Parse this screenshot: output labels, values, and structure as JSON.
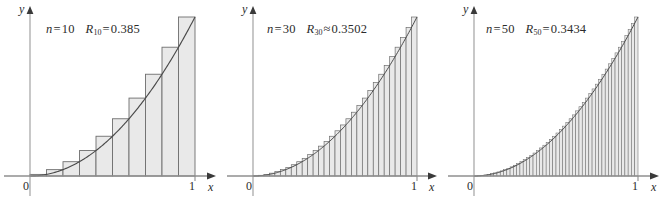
{
  "figure": {
    "background_color": "#ffffff",
    "bar_fill_color": "#e9e9e9",
    "bar_stroke_color": "#6e6e6e",
    "curve_color": "#4a4a4a",
    "axis_color": "#8a8a8a",
    "text_color": "#2b2b2b"
  },
  "panels": [
    {
      "id": "panel-n10",
      "annotation": {
        "n_symbol": "n",
        "n_relation": "=",
        "n_value": "10",
        "r_symbol": "R",
        "r_subscript": "10",
        "r_relation": "=",
        "r_value": "0.385",
        "full_text": "n = 10   R10 = 0.385"
      },
      "axes": {
        "y_label": "y",
        "x_label": "x",
        "origin_label": "0",
        "right_tick_label": "1"
      }
    },
    {
      "id": "panel-n30",
      "annotation": {
        "n_symbol": "n",
        "n_relation": "=",
        "n_value": "30",
        "r_symbol": "R",
        "r_subscript": "30",
        "r_relation": "≈",
        "r_value": "0.3502",
        "full_text": "n = 30   R30 ≈ 0.3502"
      },
      "axes": {
        "y_label": "y",
        "x_label": "x",
        "origin_label": "0",
        "right_tick_label": "1"
      }
    },
    {
      "id": "panel-n50",
      "annotation": {
        "n_symbol": "n",
        "n_relation": "=",
        "n_value": "50",
        "r_symbol": "R",
        "r_subscript": "50",
        "r_relation": "=",
        "r_value": "0.3434",
        "full_text": "n = 50   R50 = 0.3434"
      },
      "axes": {
        "y_label": "y",
        "x_label": "x",
        "origin_label": "0",
        "right_tick_label": "1"
      }
    }
  ],
  "chart_data": [
    {
      "type": "bar",
      "title": "n = 10   R10 = 0.385",
      "xlabel": "x",
      "ylabel": "y",
      "xlim": [
        0,
        1
      ],
      "ylim": [
        0,
        1
      ],
      "grid": false,
      "legend": "none",
      "function": "y = x^2",
      "method": "right endpoint Riemann sum",
      "n": 10,
      "riemann_sum": 0.385,
      "relation": "=",
      "tick_labels_x": [
        "0",
        "1"
      ],
      "bar_width": 0.1,
      "x_right_endpoints": [
        0.1,
        0.2,
        0.3,
        0.4,
        0.5,
        0.6,
        0.7,
        0.8,
        0.9,
        1.0
      ],
      "values": [
        0.01,
        0.04,
        0.09,
        0.16,
        0.25,
        0.36,
        0.49,
        0.64,
        0.81,
        1.0
      ],
      "curve": {
        "name": "y = x^2",
        "x": [
          0,
          0.1,
          0.2,
          0.3,
          0.4,
          0.5,
          0.6,
          0.7,
          0.8,
          0.9,
          1.0
        ],
        "y": [
          0,
          0.01,
          0.04,
          0.09,
          0.16,
          0.25,
          0.36,
          0.49,
          0.64,
          0.81,
          1.0
        ]
      }
    },
    {
      "type": "bar",
      "title": "n = 30   R30 ≈ 0.3502",
      "xlabel": "x",
      "ylabel": "y",
      "xlim": [
        0,
        1
      ],
      "ylim": [
        0,
        1
      ],
      "grid": false,
      "legend": "none",
      "function": "y = x^2",
      "method": "right endpoint Riemann sum",
      "n": 30,
      "riemann_sum": 0.3502,
      "relation": "≈",
      "tick_labels_x": [
        "0",
        "1"
      ],
      "bar_width": 0.03333,
      "x_right_endpoints": [
        0.0333,
        0.0667,
        0.1,
        0.1333,
        0.1667,
        0.2,
        0.2333,
        0.2667,
        0.3,
        0.3333,
        0.3667,
        0.4,
        0.4333,
        0.4667,
        0.5,
        0.5333,
        0.5667,
        0.6,
        0.6333,
        0.6667,
        0.7,
        0.7333,
        0.7667,
        0.8,
        0.8333,
        0.8667,
        0.9,
        0.9333,
        0.9667,
        1.0
      ],
      "values": [
        0.0011,
        0.0044,
        0.01,
        0.0178,
        0.0278,
        0.04,
        0.0544,
        0.0711,
        0.09,
        0.1111,
        0.1344,
        0.16,
        0.1878,
        0.2178,
        0.25,
        0.2844,
        0.3211,
        0.36,
        0.4011,
        0.4444,
        0.49,
        0.5378,
        0.5878,
        0.64,
        0.6944,
        0.7511,
        0.81,
        0.8711,
        0.9344,
        1.0
      ],
      "curve": {
        "name": "y = x^2",
        "x": [
          0,
          0.25,
          0.5,
          0.75,
          1.0
        ],
        "y": [
          0,
          0.0625,
          0.25,
          0.5625,
          1.0
        ]
      }
    },
    {
      "type": "bar",
      "title": "n = 50   R50 = 0.3434",
      "xlabel": "x",
      "ylabel": "y",
      "xlim": [
        0,
        1
      ],
      "ylim": [
        0,
        1
      ],
      "grid": false,
      "legend": "none",
      "function": "y = x^2",
      "method": "right endpoint Riemann sum",
      "n": 50,
      "riemann_sum": 0.3434,
      "relation": "=",
      "tick_labels_x": [
        "0",
        "1"
      ],
      "bar_width": 0.02,
      "x_right_endpoints": [
        0.02,
        0.04,
        0.06,
        0.08,
        0.1,
        0.12,
        0.14,
        0.16,
        0.18,
        0.2,
        0.22,
        0.24,
        0.26,
        0.28,
        0.3,
        0.32,
        0.34,
        0.36,
        0.38,
        0.4,
        0.42,
        0.44,
        0.46,
        0.48,
        0.5,
        0.52,
        0.54,
        0.56,
        0.58,
        0.6,
        0.62,
        0.64,
        0.66,
        0.68,
        0.7,
        0.72,
        0.74,
        0.76,
        0.78,
        0.8,
        0.82,
        0.84,
        0.86,
        0.88,
        0.9,
        0.92,
        0.94,
        0.96,
        0.98,
        1.0
      ],
      "values": [
        0.0004,
        0.0016,
        0.0036,
        0.0064,
        0.01,
        0.0144,
        0.0196,
        0.0256,
        0.0324,
        0.04,
        0.0484,
        0.0576,
        0.0676,
        0.0784,
        0.09,
        0.1024,
        0.1156,
        0.1296,
        0.1444,
        0.16,
        0.1764,
        0.1936,
        0.2116,
        0.2304,
        0.25,
        0.2704,
        0.2916,
        0.3136,
        0.3364,
        0.36,
        0.3844,
        0.4096,
        0.4356,
        0.4624,
        0.49,
        0.5184,
        0.5476,
        0.5776,
        0.6084,
        0.64,
        0.6724,
        0.7056,
        0.7396,
        0.7744,
        0.81,
        0.8464,
        0.8836,
        0.9216,
        0.9604,
        1.0
      ],
      "curve": {
        "name": "y = x^2",
        "x": [
          0,
          0.25,
          0.5,
          0.75,
          1.0
        ],
        "y": [
          0,
          0.0625,
          0.25,
          0.5625,
          1.0
        ]
      }
    }
  ]
}
